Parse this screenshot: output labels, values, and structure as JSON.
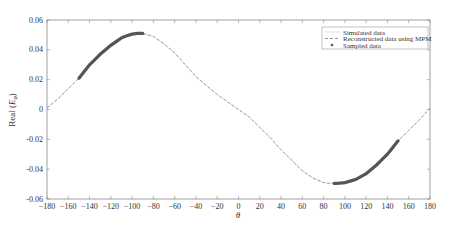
{
  "chart_data": {
    "type": "line",
    "title": "",
    "xlabel": "θ",
    "ylabel": "Real (E_φ)",
    "ylabel_main": "Real (",
    "ylabel_sym": "E",
    "ylabel_sub": "φ",
    "ylabel_close": ")",
    "xlim": [
      -180,
      180
    ],
    "ylim": [
      -0.06,
      0.06
    ],
    "xticks": [
      -180,
      -160,
      -140,
      -120,
      -100,
      -80,
      -60,
      -40,
      -20,
      0,
      20,
      40,
      60,
      80,
      100,
      120,
      140,
      160,
      180
    ],
    "yticks": [
      0.06,
      0.04,
      0.02,
      0,
      -0.02,
      -0.04,
      -0.06
    ],
    "ytick_labels": [
      "0.06",
      "0.04",
      "0.02",
      "0",
      "-0.02",
      "-0.04",
      "-0.06"
    ],
    "grid": false,
    "legend_position": "upper right",
    "legend": [
      "Simulated data",
      "Reconstructed data using MPM",
      "Sampled data"
    ],
    "series": [
      {
        "name": "Simulated data",
        "style": "dotted",
        "x": [
          -180,
          -170,
          -160,
          -150,
          -140,
          -130,
          -120,
          -110,
          -100,
          -95,
          -90,
          -80,
          -70,
          -60,
          -50,
          -40,
          -30,
          -20,
          -10,
          0,
          10,
          20,
          30,
          40,
          50,
          60,
          70,
          80,
          85,
          90,
          100,
          110,
          120,
          130,
          140,
          150,
          160,
          170,
          180
        ],
        "values": [
          0.001,
          0.007,
          0.014,
          0.021,
          0.03,
          0.037,
          0.043,
          0.048,
          0.0505,
          0.051,
          0.051,
          0.049,
          0.044,
          0.038,
          0.03,
          0.022,
          0.016,
          0.01,
          0.005,
          0.0,
          -0.005,
          -0.012,
          -0.019,
          -0.027,
          -0.034,
          -0.041,
          -0.046,
          -0.049,
          -0.0495,
          -0.0495,
          -0.049,
          -0.047,
          -0.043,
          -0.037,
          -0.03,
          -0.021,
          -0.014,
          -0.007,
          0.001
        ]
      },
      {
        "name": "Reconstructed data using MPM",
        "style": "dashed",
        "x": [
          -180,
          -170,
          -160,
          -150,
          -140,
          -130,
          -120,
          -110,
          -100,
          -95,
          -90,
          -80,
          -70,
          -60,
          -50,
          -40,
          -30,
          -20,
          -10,
          0,
          10,
          20,
          30,
          40,
          50,
          60,
          70,
          80,
          85,
          90,
          100,
          110,
          120,
          130,
          140,
          150,
          160,
          170,
          180
        ],
        "values": [
          0.001,
          0.007,
          0.014,
          0.021,
          0.03,
          0.037,
          0.043,
          0.048,
          0.0505,
          0.051,
          0.051,
          0.049,
          0.044,
          0.038,
          0.03,
          0.022,
          0.016,
          0.01,
          0.005,
          0.0,
          -0.005,
          -0.012,
          -0.019,
          -0.027,
          -0.034,
          -0.041,
          -0.046,
          -0.049,
          -0.0495,
          -0.0495,
          -0.049,
          -0.047,
          -0.043,
          -0.037,
          -0.03,
          -0.021,
          -0.014,
          -0.007,
          0.001
        ]
      },
      {
        "name": "Sampled data",
        "style": "markers",
        "x": [
          -150,
          -145,
          -140,
          -135,
          -130,
          -125,
          -120,
          -115,
          -110,
          -105,
          -100,
          -95,
          -90,
          90,
          95,
          100,
          105,
          110,
          115,
          120,
          125,
          130,
          135,
          140,
          145,
          150
        ],
        "values": [
          0.021,
          0.0255,
          0.03,
          0.0335,
          0.037,
          0.04,
          0.043,
          0.0455,
          0.048,
          0.0495,
          0.0505,
          0.051,
          0.051,
          -0.0495,
          -0.0493,
          -0.049,
          -0.048,
          -0.047,
          -0.045,
          -0.043,
          -0.04,
          -0.037,
          -0.0335,
          -0.03,
          -0.0255,
          -0.021
        ]
      }
    ]
  },
  "colors": {
    "curve": "#9a9a9a",
    "sampled": "#555555",
    "axis": "#888888",
    "text": "#333333"
  }
}
